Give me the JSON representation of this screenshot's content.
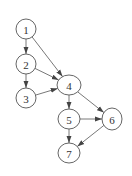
{
  "diagram": {
    "type": "directed-graph",
    "nodes": [
      {
        "id": "1",
        "label": "1",
        "x": 26,
        "y": 29,
        "rx": 10,
        "ry": 10
      },
      {
        "id": "2",
        "label": "2",
        "x": 26,
        "y": 64,
        "rx": 10,
        "ry": 10
      },
      {
        "id": "3",
        "label": "3",
        "x": 26,
        "y": 98,
        "rx": 10,
        "ry": 10
      },
      {
        "id": "4",
        "label": "4",
        "x": 69,
        "y": 85,
        "rx": 12,
        "ry": 10
      },
      {
        "id": "5",
        "label": "5",
        "x": 69,
        "y": 119,
        "rx": 11,
        "ry": 10
      },
      {
        "id": "6",
        "label": "6",
        "x": 112,
        "y": 119,
        "rx": 10,
        "ry": 11
      },
      {
        "id": "7",
        "label": "7",
        "x": 69,
        "y": 153,
        "rx": 11,
        "ry": 10
      }
    ],
    "edges": [
      {
        "from": "1",
        "to": "2"
      },
      {
        "from": "1",
        "to": "4"
      },
      {
        "from": "2",
        "to": "3"
      },
      {
        "from": "2",
        "to": "4"
      },
      {
        "from": "3",
        "to": "4"
      },
      {
        "from": "4",
        "to": "5"
      },
      {
        "from": "4",
        "to": "6"
      },
      {
        "from": "5",
        "to": "6"
      },
      {
        "from": "5",
        "to": "7"
      },
      {
        "from": "6",
        "to": "7"
      }
    ]
  }
}
